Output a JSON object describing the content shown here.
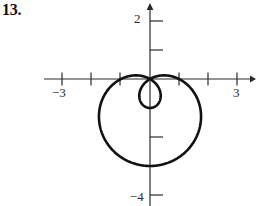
{
  "problem": {
    "number": "13."
  },
  "chart_data": {
    "type": "line",
    "title": "",
    "subtitle": "",
    "xlabel": "",
    "ylabel": "",
    "grid": false,
    "legend_position": "none",
    "curve_name": "limacon-with-inner-loop",
    "polar_equation": "r = 1 - 2 sin(theta)",
    "xlim": [
      -3.6,
      3.6
    ],
    "ylim": [
      -4.4,
      2.4
    ],
    "origin_px": {
      "x": 150,
      "y": 79
    },
    "pixels_per_unit": {
      "x": 29,
      "y": 29
    },
    "x_axis": {
      "tick_values": [
        -3,
        -2,
        -1,
        1,
        2,
        3
      ],
      "labeled_ticks": [
        {
          "value": -3,
          "label": "−3"
        },
        {
          "value": 3,
          "label": "3"
        }
      ],
      "arrow": "right"
    },
    "y_axis": {
      "tick_values": [
        2,
        1,
        -1,
        -2,
        -3,
        -4
      ],
      "labeled_ticks": [
        {
          "value": 2,
          "label": "2"
        },
        {
          "value": -4,
          "label": "−4"
        }
      ],
      "arrow": "up"
    },
    "curve": {
      "stroke": "#111111",
      "stroke_width": 2.6,
      "closed": true,
      "self_intersection": {
        "x": 0,
        "y": 0
      },
      "outer_extent": {
        "left": -1.69,
        "right": 1.66,
        "bottom": -3.34,
        "top": 0
      },
      "inner_loop_extent": {
        "left": -0.41,
        "right": 0.45,
        "bottom": -1.0,
        "top": 0
      },
      "points": [
        [
          0.0,
          0.0
        ],
        [
          -0.2071,
          -0.0355
        ],
        [
          -0.4054,
          -0.1416
        ],
        [
          -0.5878,
          -0.3131
        ],
        [
          -0.7478,
          -0.5412
        ],
        [
          -0.8794,
          -0.8138
        ],
        [
          -0.9777,
          -1.1161
        ],
        [
          -1.0392,
          -1.4313
        ],
        [
          -1.0614,
          -1.7417
        ],
        [
          -1.044,
          -2.0293
        ],
        [
          -0.9877,
          -2.2775
        ],
        [
          -0.8954,
          -2.4712
        ],
        [
          -0.7713,
          -2.5983
        ],
        [
          -0.6212,
          -2.6499
        ],
        [
          -0.4519,
          -2.6213
        ],
        [
          -0.271,
          -2.5117
        ],
        [
          -0.0864,
          -2.3247
        ],
        [
          0.0941,
          -2.0676
        ],
        [
          0.2633,
          -1.7514
        ],
        [
          0.4148,
          -1.3905
        ],
        [
          0.5432,
          -1.0017
        ],
        [
          0.6441,
          -0.6036
        ],
        [
          0.7146,
          -0.2151
        ],
        [
          0.7532,
          0.1457
        ],
        [
          0.76,
          0.4628
        ],
        [
          0.7366,
          0.723
        ],
        [
          0.686,
          0.9162
        ],
        [
          0.6125,
          1.0357
        ],
        [
          0.5214,
          1.0784
        ],
        [
          0.4188,
          1.0448
        ],
        [
          0.3111,
          0.9384
        ],
        [
          0.2046,
          0.7658
        ],
        [
          0.1053,
          0.5363
        ],
        [
          0.0187,
          0.2612
        ],
        [
          -0.0508,
          -0.0466
        ],
        [
          -0.1,
          -0.3729
        ],
        [
          -0.1269,
          -0.7031
        ],
        [
          -0.1307,
          -1.0226
        ],
        [
          -0.1121,
          -1.3174
        ],
        [
          -0.0727,
          -1.5747
        ],
        [
          -0.0155,
          -1.7834
        ],
        [
          0.056,
          -1.9343
        ],
        [
          0.1373,
          -2.0209
        ],
        [
          0.2234,
          -2.0391
        ],
        [
          0.3089,
          -1.9879
        ],
        [
          0.3885,
          -1.8691
        ],
        [
          0.4572,
          -1.6874
        ],
        [
          0.5105,
          -1.4502
        ],
        [
          0.5451,
          -1.1677
        ],
        [
          0.5585,
          -0.8517
        ],
        [
          0.5494,
          -0.5157
        ],
        [
          0.5176,
          -0.1739
        ],
        [
          0.4642,
          0.1589
        ],
        [
          0.3912,
          0.4684
        ],
        [
          0.3018,
          0.741
        ],
        [
          0.2,
          0.965
        ],
        [
          0.0903,
          1.1304
        ],
        [
          -0.0223,
          1.2298
        ],
        [
          -0.133,
          1.2584
        ],
        [
          -0.2369,
          1.2145
        ],
        [
          -0.3297,
          1.0995
        ],
        [
          -0.4074,
          0.9178
        ],
        [
          -0.4668,
          0.6768
        ],
        [
          -0.5054,
          0.3865
        ],
        [
          -0.5216,
          0.0591
        ],
        [
          -0.5145,
          -0.2919
        ],
        [
          -0.4842,
          -0.6516
        ],
        [
          -0.4318,
          -1.0048
        ],
        [
          -0.3589,
          -1.3358
        ],
        [
          -0.2684,
          -1.6295
        ],
        [
          -0.1634,
          -1.8714
        ],
        [
          -0.0478,
          -2.0487
        ],
        [
          0.0739,
          -2.1504
        ],
        [
          0.1973,
          -2.1677
        ],
        [
          0.3173,
          -2.0944
        ],
        [
          0.4293,
          -1.9275
        ],
        [
          0.5285,
          -1.6667
        ],
        [
          0.6107,
          -1.3155
        ],
        [
          0.6723,
          -0.8798
        ],
        [
          0.7103,
          -0.369
        ],
        [
          0.7226,
          0.205
        ],
        [
          0.708,
          0.828
        ],
        [
          0.6663,
          1.4836
        ],
        [
          0.5983,
          2.1539
        ],
        [
          0.0,
          0.0
        ]
      ]
    }
  }
}
